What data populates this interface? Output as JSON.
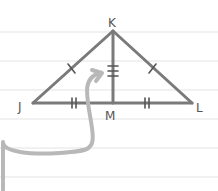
{
  "diagram": {
    "type": "isosceles-triangle-with-altitude",
    "vertices": {
      "K": "K",
      "J": "J",
      "L": "L",
      "M": "M"
    },
    "segments": [
      "JK",
      "KL",
      "JL",
      "KM"
    ],
    "congruence_marks": {
      "JK": "single tick",
      "KL": "single tick",
      "JM": "double tick",
      "ML": "double tick",
      "KM": "triple tick"
    },
    "annotation": "curved gray arrow pointing to segment KM",
    "background": "ruled notebook paper",
    "colors": {
      "lines": "#7a7a7a",
      "arrow": "#b8b8b8",
      "rules": "#e4e4e4"
    }
  }
}
